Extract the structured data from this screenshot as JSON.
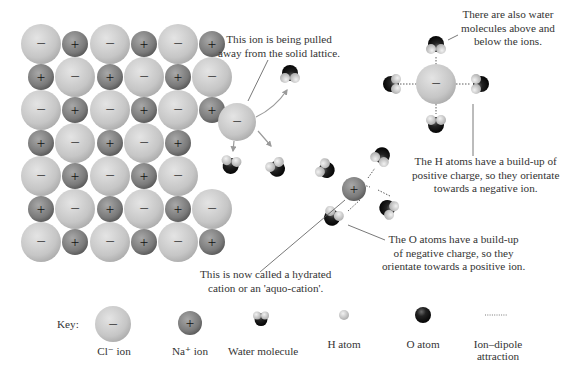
{
  "colors": {
    "cl_ion": "#c9c9c9",
    "na_ion": "#7d7d7d",
    "o_atom": "#151515",
    "h_atom": "#cfcfcf",
    "text": "#333333",
    "arrow": "#9a9a9a"
  },
  "lattice": {
    "rows": [
      [
        "-",
        "+",
        "-",
        "+",
        "-",
        "+"
      ],
      [
        "+",
        "-",
        "+",
        "-",
        "+",
        "-"
      ],
      [
        "-",
        "+",
        "-",
        "+",
        "-",
        "+"
      ],
      [
        "+",
        "-",
        "+",
        "-",
        "+",
        null
      ],
      [
        "-",
        "+",
        "-",
        "+",
        "-",
        null
      ],
      [
        "+",
        "-",
        "+",
        "-",
        "+",
        "-"
      ],
      [
        "-",
        "+",
        "-",
        "+",
        "-",
        "+"
      ]
    ]
  },
  "annotations": {
    "pulled_ion": [
      "This ion is being pulled",
      "away from the solid lattice."
    ],
    "water_above_below": [
      "There are also water",
      "molecules above and",
      "below the ions."
    ],
    "h_atoms": [
      "The H atoms have a build-up of",
      "positive charge, so they orientate",
      "towards a negative ion."
    ],
    "o_atoms": [
      "The O atoms have a build-up",
      "of negative charge, so they",
      "orientate towards a positive ion."
    ],
    "hydrated_cation": [
      "This is now called a hydrated",
      "cation or an 'aquo-cation'."
    ]
  },
  "symbols": {
    "minus": "−",
    "plus": "+"
  },
  "key": {
    "title": "Key:",
    "items": [
      {
        "id": "cl",
        "label": "Cl⁻ ion"
      },
      {
        "id": "na",
        "label": "Na⁺ ion"
      },
      {
        "id": "water",
        "label": "Water molecule"
      },
      {
        "id": "h",
        "label": "H atom"
      },
      {
        "id": "o",
        "label": "O atom"
      },
      {
        "id": "dipole",
        "label_line1": "Ion–dipole",
        "label_line2": "attraction"
      }
    ]
  }
}
